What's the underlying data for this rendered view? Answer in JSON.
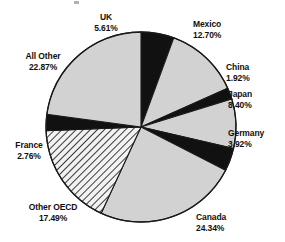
{
  "chart_data": {
    "type": "pie",
    "title": "",
    "subtitle": "",
    "xlabel": "",
    "ylabel": "",
    "legend_position": "none",
    "grid": false,
    "units": "percent",
    "start_angle_deg": 0,
    "direction": "clockwise",
    "categories": [
      "UK",
      "Mexico",
      "China",
      "Japan",
      "Germany",
      "Canada",
      "Other OECD",
      "France",
      "All Other"
    ],
    "values": [
      5.61,
      12.7,
      1.92,
      8.4,
      3.92,
      24.34,
      17.49,
      2.76,
      22.87
    ],
    "labels": [
      {
        "name": "UK",
        "percent": "5.61%",
        "value": 5.61,
        "fill": "black"
      },
      {
        "name": "Mexico",
        "percent": "12.70%",
        "value": 12.7,
        "fill": "gray"
      },
      {
        "name": "China",
        "percent": "1.92%",
        "value": 1.92,
        "fill": "black"
      },
      {
        "name": "Japan",
        "percent": "8.40%",
        "value": 8.4,
        "fill": "gray"
      },
      {
        "name": "Germany",
        "percent": "3.92%",
        "value": 3.92,
        "fill": "black"
      },
      {
        "name": "Canada",
        "percent": "24.34%",
        "value": 24.34,
        "fill": "gray"
      },
      {
        "name": "Other OECD",
        "percent": "17.49%",
        "value": 17.49,
        "fill": "hatched"
      },
      {
        "name": "France",
        "percent": "2.76%",
        "value": 2.76,
        "fill": "black"
      },
      {
        "name": "All Other",
        "percent": "22.87%",
        "value": 22.87,
        "fill": "gray"
      }
    ],
    "colors": {
      "slice_black": "#111111",
      "slice_gray": "#d2d2d2",
      "slice_hatch_bg": "#f2f2f2",
      "slice_hatch_line": "#1a1a1a",
      "outline": "#1a1a1a",
      "label_text": "#101010",
      "background": "#ffffff"
    }
  }
}
